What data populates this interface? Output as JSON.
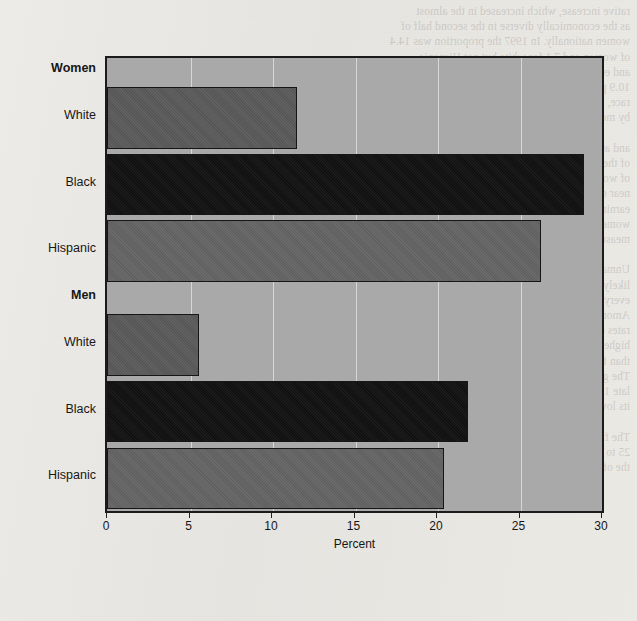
{
  "figure": {
    "background_color": "#eceae6",
    "plot_background_color": "#a9a9a9",
    "frame_color": "#1b1b1b",
    "bleed_through_text": "rative increase, which increased in the almost\nas the economically diverse in the second half of\nwomen nationally. In 1997 the proportion was 14.4\nof women and 7.1 for white but not Hispanic\nand economically diverse in the 1970s when\n10.9 percent of women compared with 12.5 as the\nrace, income, and location. Over the last decade\nby more than that the share of the total was at\n\nand at the same time that the number\nof the population increased, the proportion\nof women in the labor force rose to\nnear one-half of all workers. Median\nearnings, however, remained lower for\nwomen than for men in every category\nmeasured by the survey over the period.\n\nUnmarried women with children were most\nlikely to be counted among the poor in\nevery year of the period covered here.\nAmong women 25 to 34 years old, the\nrates of poverty were consistently\nhigher for black and Hispanic women\nthan for white, non-Hispanic women.\nThe gap narrowed somewhat during the\nlate 1990s, when unemployment fell to\nits lowest level in three decades.\n\nThe figures shown are for persons\n25 to 34 years of age who were below\nthe official poverty threshold."
  },
  "chart_data": {
    "type": "bar",
    "orientation": "horizontal",
    "title": "",
    "xlabel": "Percent",
    "ylabel": "",
    "xlim": [
      0,
      30
    ],
    "xticks": [
      0,
      5,
      10,
      15,
      20,
      25,
      30
    ],
    "xtick_labels": [
      "0",
      "5",
      "10",
      "15",
      "20",
      "25",
      "30"
    ],
    "grid": true,
    "legend": false,
    "groups": [
      {
        "label": "Women",
        "is_header": true,
        "bars": [
          {
            "label": "White",
            "value": 11.5,
            "color": "#5a5a5a",
            "class": "white-bar"
          },
          {
            "label": "Black",
            "value": 28.9,
            "color": "#111111",
            "class": "black-bar"
          },
          {
            "label": "Hispanic",
            "value": 26.3,
            "color": "#646464",
            "class": "hispanic-bar"
          }
        ]
      },
      {
        "label": "Men",
        "is_header": true,
        "bars": [
          {
            "label": "White",
            "value": 5.6,
            "color": "#5a5a5a",
            "class": "white-bar"
          },
          {
            "label": "Black",
            "value": 21.9,
            "color": "#111111",
            "class": "black-bar"
          },
          {
            "label": "Hispanic",
            "value": 20.4,
            "color": "#646464",
            "class": "hispanic-bar"
          }
        ]
      }
    ],
    "categories": [
      "Women: White",
      "Women: Black",
      "Women: Hispanic",
      "Men: White",
      "Men: Black",
      "Men: Hispanic"
    ],
    "values": [
      11.5,
      28.9,
      26.3,
      5.6,
      21.9,
      20.4
    ]
  }
}
